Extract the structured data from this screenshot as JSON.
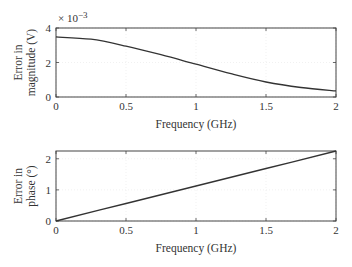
{
  "chart_data": [
    {
      "type": "line",
      "title": "",
      "xlabel": "Frequency (GHz)",
      "ylabel_lines": [
        "Error in",
        "magnitude (V)"
      ],
      "y_multiplier": "× 10",
      "y_exponent": "−3",
      "xlim": [
        0,
        2
      ],
      "ylim": [
        0,
        4
      ],
      "xticks": [
        "0",
        "0.5",
        "1",
        "1.5",
        "2"
      ],
      "yticks": [
        "0",
        "2",
        "4"
      ],
      "grid": true,
      "series": [
        {
          "name": "magnitude error",
          "x": [
            0,
            0.25,
            0.5,
            0.75,
            1.0,
            1.25,
            1.5,
            1.75,
            2.0
          ],
          "values": [
            3.48,
            3.35,
            2.95,
            2.45,
            1.9,
            1.35,
            0.87,
            0.55,
            0.35
          ],
          "unit": "×10^-3 V"
        }
      ]
    },
    {
      "type": "line",
      "title": "",
      "xlabel": "Frequency (GHz)",
      "ylabel_lines": [
        "Error in",
        "phase (°)"
      ],
      "xlim": [
        0,
        2
      ],
      "ylim": [
        0,
        2.25
      ],
      "xticks": [
        "0",
        "0.5",
        "1",
        "1.5",
        "2"
      ],
      "yticks": [
        "0",
        "1",
        "2"
      ],
      "grid": true,
      "series": [
        {
          "name": "phase error",
          "x": [
            0,
            0.5,
            1.0,
            1.5,
            2.0
          ],
          "values": [
            0,
            0.5625,
            1.125,
            1.6875,
            2.25
          ],
          "unit": "degrees"
        }
      ]
    }
  ]
}
